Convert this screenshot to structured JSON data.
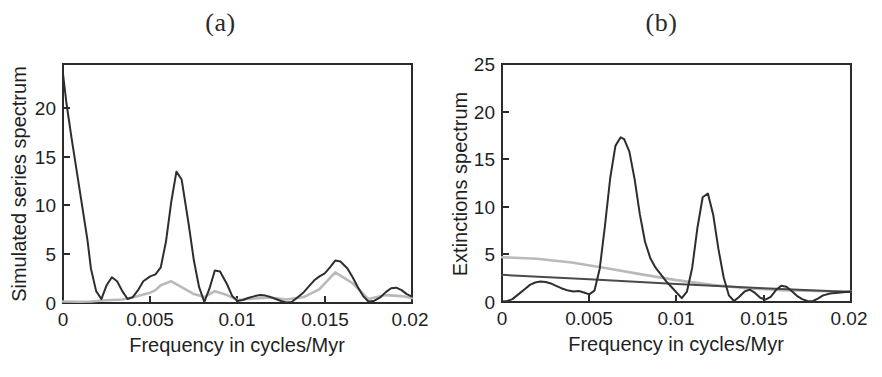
{
  "figure": {
    "background": "#ffffff",
    "panel_count": 2
  },
  "panels": [
    {
      "id": "a",
      "title": "(a)",
      "xlabel": "Frequency in cycles/Myr",
      "ylabel": "Simulated series spectrum"
    },
    {
      "id": "b",
      "title": "(b)",
      "xlabel": "Frequency in cycles/Myr",
      "ylabel": "Extinctions spectrum"
    }
  ],
  "chart_data": [
    {
      "type": "line",
      "title": "(a)",
      "xlabel": "Frequency in cycles/Myr",
      "ylabel": "Simulated series spectrum",
      "xlim": [
        0,
        0.02
      ],
      "ylim": [
        0,
        24.2
      ],
      "grid": false,
      "legend": "none",
      "xticks": [
        0,
        0.005,
        0.01,
        0.015,
        0.02
      ],
      "xtick_labels": [
        "0",
        "0.005",
        "0.01",
        "0.015",
        "0.02"
      ],
      "yticks": [
        0,
        5,
        10,
        15,
        20
      ],
      "ytick_labels": [
        "0",
        "5",
        "10",
        "15",
        "20"
      ],
      "colors": {
        "spectrum": "#2e2e2e",
        "confidence": "#b9b9b9"
      },
      "series": [
        {
          "name": "simulated series spectrum",
          "color": "#2e2e2e",
          "x": [
            0.0,
            0.0002,
            0.0005,
            0.0008,
            0.0011,
            0.0014,
            0.0016,
            0.0019,
            0.0022,
            0.0025,
            0.0028,
            0.0031,
            0.0034,
            0.0037,
            0.004,
            0.0043,
            0.0046,
            0.005,
            0.0053,
            0.0056,
            0.0059,
            0.0062,
            0.0065,
            0.0068,
            0.0072,
            0.0075,
            0.0078,
            0.0081,
            0.0084,
            0.0087,
            0.009,
            0.0094,
            0.0097,
            0.01,
            0.0103,
            0.0106,
            0.011,
            0.0113,
            0.0116,
            0.0119,
            0.0122,
            0.0125,
            0.0128,
            0.0131,
            0.0134,
            0.0138,
            0.0141,
            0.0144,
            0.0147,
            0.015,
            0.0153,
            0.0156,
            0.0159,
            0.0163,
            0.0166,
            0.0169,
            0.0172,
            0.0175,
            0.0178,
            0.0182,
            0.0185,
            0.0188,
            0.0191,
            0.0194,
            0.0197,
            0.02
          ],
          "y": [
            23.2,
            20.2,
            16.6,
            13.2,
            9.8,
            6.4,
            3.5,
            1.2,
            0.4,
            1.8,
            2.6,
            2.2,
            1.2,
            0.4,
            0.6,
            1.3,
            2.2,
            2.7,
            2.9,
            3.6,
            6.2,
            10.2,
            13.3,
            12.5,
            8.0,
            4.3,
            1.6,
            0.1,
            1.5,
            3.3,
            3.2,
            1.9,
            0.7,
            0.2,
            0.3,
            0.5,
            0.7,
            0.8,
            0.75,
            0.6,
            0.4,
            0.2,
            0.05,
            0.1,
            0.5,
            1.1,
            1.7,
            2.3,
            2.7,
            3.0,
            3.6,
            4.3,
            4.2,
            3.5,
            2.6,
            1.6,
            0.7,
            0.15,
            0.2,
            0.6,
            1.1,
            1.5,
            1.55,
            1.3,
            0.9,
            0.65
          ]
        },
        {
          "name": "confidence / noise level",
          "color": "#b9b9b9",
          "x": [
            0.0,
            0.001,
            0.0016,
            0.0022,
            0.0028,
            0.0034,
            0.004,
            0.0046,
            0.005,
            0.0053,
            0.0056,
            0.0062,
            0.0068,
            0.0075,
            0.0081,
            0.0087,
            0.0094,
            0.01,
            0.011,
            0.0119,
            0.0128,
            0.0138,
            0.0147,
            0.0156,
            0.0166,
            0.0175,
            0.0185,
            0.0194,
            0.02
          ],
          "y": [
            0.15,
            0.12,
            0.15,
            0.25,
            0.3,
            0.35,
            0.55,
            0.85,
            1.05,
            1.3,
            1.8,
            2.2,
            1.6,
            0.9,
            0.6,
            1.2,
            0.8,
            0.3,
            0.45,
            0.55,
            0.35,
            0.6,
            1.4,
            3.1,
            2.0,
            0.4,
            0.8,
            0.7,
            0.5
          ]
        }
      ]
    },
    {
      "type": "line",
      "title": "(b)",
      "xlabel": "Frequency in cycles/Myr",
      "ylabel": "Extinctions spectrum",
      "xlim": [
        0,
        0.02
      ],
      "ylim": [
        0,
        25
      ],
      "grid": false,
      "legend": "none",
      "xticks": [
        0,
        0.005,
        0.01,
        0.015,
        0.02
      ],
      "xtick_labels": [
        "0",
        "0.005",
        "0.01",
        "0.015",
        "0.02"
      ],
      "yticks": [
        0,
        5,
        10,
        15,
        20,
        25
      ],
      "ytick_labels": [
        "0",
        "5",
        "10",
        "15",
        "20",
        "25"
      ],
      "colors": {
        "spectrum": "#2e2e2e",
        "upper_confidence": "#b9b9b9",
        "lower_confidence": "#4a4a4a"
      },
      "series": [
        {
          "name": "extinctions spectrum",
          "color": "#2e2e2e",
          "x": [
            0.0,
            0.0003,
            0.0006,
            0.0009,
            0.0013,
            0.0016,
            0.0019,
            0.0022,
            0.0025,
            0.0028,
            0.0031,
            0.0034,
            0.0038,
            0.0041,
            0.0044,
            0.0047,
            0.005,
            0.0053,
            0.0056,
            0.0059,
            0.0062,
            0.0065,
            0.0068,
            0.007,
            0.0073,
            0.0076,
            0.0079,
            0.0082,
            0.0085,
            0.0088,
            0.0091,
            0.0094,
            0.0097,
            0.01,
            0.0103,
            0.0106,
            0.0109,
            0.0112,
            0.0115,
            0.0118,
            0.0121,
            0.0124,
            0.0127,
            0.013,
            0.0133,
            0.0136,
            0.0139,
            0.0142,
            0.0145,
            0.0148,
            0.0151,
            0.0154,
            0.0157,
            0.016,
            0.0163,
            0.0166,
            0.0169,
            0.0172,
            0.0175,
            0.0178,
            0.0181,
            0.0184,
            0.0188,
            0.0191,
            0.0194,
            0.0197,
            0.02
          ],
          "y": [
            0.05,
            0.1,
            0.3,
            0.75,
            1.35,
            1.8,
            2.05,
            2.15,
            2.1,
            1.95,
            1.7,
            1.45,
            1.2,
            1.1,
            1.15,
            1.0,
            0.8,
            1.2,
            3.5,
            8.0,
            13.0,
            16.4,
            17.3,
            17.1,
            15.8,
            12.9,
            9.2,
            6.3,
            4.6,
            3.6,
            2.9,
            2.2,
            1.6,
            1.0,
            0.4,
            1.1,
            3.6,
            7.8,
            11.0,
            11.4,
            9.2,
            5.6,
            2.6,
            0.7,
            0.1,
            0.55,
            1.1,
            1.3,
            0.95,
            0.45,
            0.25,
            0.55,
            1.25,
            1.7,
            1.6,
            1.15,
            0.65,
            0.3,
            0.1,
            0.08,
            0.35,
            0.7,
            0.9,
            0.95,
            1.0,
            1.05,
            1.1
          ]
        },
        {
          "name": "upper confidence level",
          "color": "#b9b9b9",
          "x": [
            0.0,
            0.002,
            0.004,
            0.006,
            0.008,
            0.01,
            0.012,
            0.014,
            0.016,
            0.018,
            0.02
          ],
          "y": [
            4.7,
            4.55,
            4.15,
            3.55,
            2.9,
            2.3,
            1.8,
            1.45,
            1.25,
            1.15,
            1.1
          ]
        },
        {
          "name": "lower confidence level",
          "color": "#4a4a4a",
          "x": [
            0.0,
            0.005,
            0.01,
            0.015,
            0.02
          ],
          "y": [
            2.85,
            2.4,
            1.9,
            1.45,
            1.05
          ]
        }
      ]
    }
  ]
}
